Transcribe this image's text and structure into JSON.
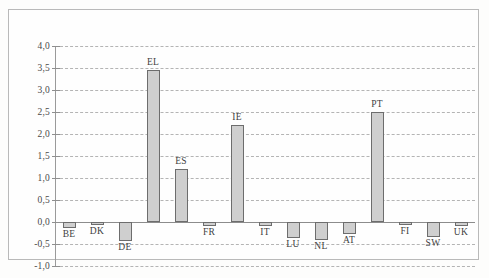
{
  "chart_data": {
    "type": "bar",
    "title": "",
    "subtitle": "",
    "xlabel": "",
    "ylabel": "",
    "grid": "horizontal-dashed",
    "legend": "none",
    "ylim": [
      -1.0,
      4.0
    ],
    "ytick_step": 0.5,
    "decimal_separator": ",",
    "ytick_labels": [
      "4,0",
      "3,5",
      "3,0",
      "2,5",
      "2,0",
      "1,5",
      "1,0",
      "0,5",
      "0,0",
      "-0,5",
      "-1,0"
    ],
    "ytick_values": [
      4.0,
      3.5,
      3.0,
      2.5,
      2.0,
      1.5,
      1.0,
      0.5,
      0.0,
      -0.5,
      -1.0
    ],
    "categories": [
      "BE",
      "DK",
      "DE",
      "EL",
      "ES",
      "FR",
      "IE",
      "IT",
      "LU",
      "NL",
      "AT",
      "PT",
      "FI",
      "SW",
      "UK"
    ],
    "values": [
      -0.14,
      -0.05,
      -0.43,
      3.45,
      1.2,
      -0.09,
      2.2,
      -0.09,
      -0.36,
      -0.41,
      -0.27,
      2.5,
      -0.05,
      -0.34,
      -0.1
    ],
    "series": [
      {
        "name": "",
        "values": [
          -0.14,
          -0.05,
          -0.43,
          3.45,
          1.2,
          -0.09,
          2.2,
          -0.09,
          -0.36,
          -0.41,
          -0.27,
          2.5,
          -0.05,
          -0.34,
          -0.1
        ]
      }
    ],
    "colors": {
      "bar_fill": "#cfcfcf",
      "bar_stroke": "#6d6d6d",
      "gridline": "#b4b4b4",
      "zero_line": "#8c8c8c",
      "axis": "#9a9a9a",
      "frame": "#b9b9b9",
      "background": "#fefefe",
      "text": "#3f3f3f"
    }
  }
}
